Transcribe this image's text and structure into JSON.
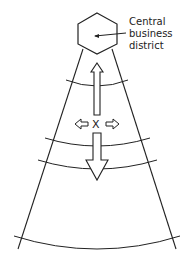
{
  "diagram": {
    "label_lines": [
      "Central",
      "business",
      "district"
    ],
    "variable_label": "X",
    "colors": {
      "stroke": "#222222",
      "background": "#ffffff"
    }
  }
}
